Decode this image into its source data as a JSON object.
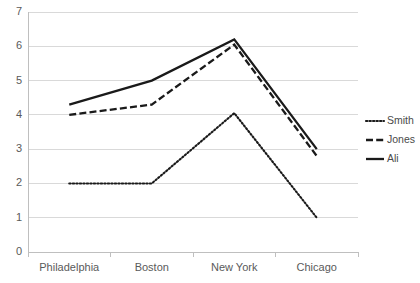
{
  "chart_data": {
    "type": "line",
    "title": "",
    "xlabel": "",
    "ylabel": "",
    "categories": [
      "Philadelphia",
      "Boston",
      "New York",
      "Chicago"
    ],
    "series": [
      {
        "name": "Smith",
        "values": [
          2.0,
          2.0,
          4.05,
          1.0
        ],
        "style": "dotted"
      },
      {
        "name": "Jones",
        "values": [
          4.0,
          4.3,
          6.05,
          2.8
        ],
        "style": "dashed"
      },
      {
        "name": "Ali",
        "values": [
          4.3,
          5.0,
          6.2,
          3.0
        ],
        "style": "solid"
      }
    ],
    "ylim": [
      0,
      7
    ],
    "y_ticks": [
      "0",
      "1",
      "2",
      "3",
      "4",
      "5",
      "6",
      "7"
    ],
    "grid": true,
    "legend_position": "right",
    "colors": {
      "line": "#1a1a1a",
      "grid": "#d9d9d9",
      "axis": "#bfbfbf",
      "text": "#5a5a5a"
    }
  },
  "legend": {
    "items": [
      {
        "label": "Smith",
        "marker": "dotted-line-icon"
      },
      {
        "label": "Jones",
        "marker": "dashed-line-icon"
      },
      {
        "label": "Ali",
        "marker": "solid-line-icon"
      }
    ]
  }
}
